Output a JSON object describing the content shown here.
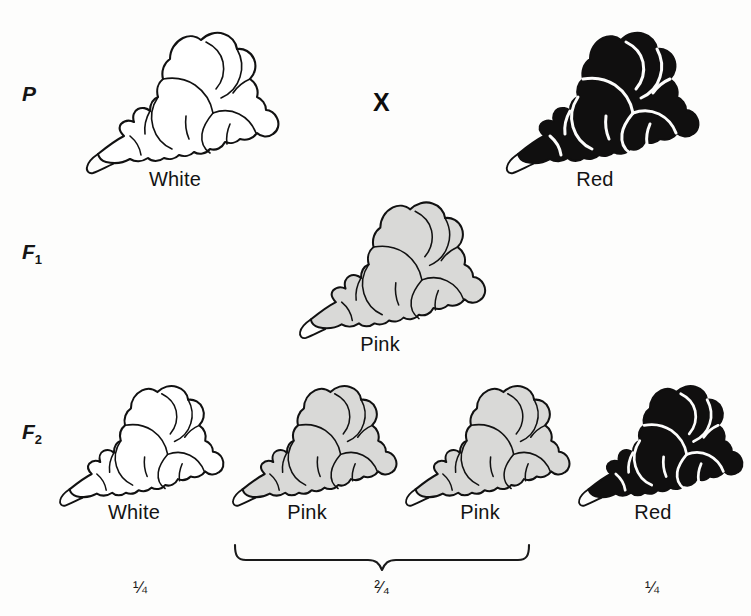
{
  "figure": {
    "background_color": "#fdfdfc"
  },
  "colors": {
    "outline": "#111111",
    "white_fill": "#ffffff",
    "pink_fill": "#d9d9d7",
    "red_fill": "#100f0f",
    "red_detail_line": "#fdfdfc"
  },
  "generations": {
    "parental": {
      "label": "P",
      "subscript": "",
      "cross_symbol": "X",
      "specimens": [
        {
          "caption": "White",
          "phenotype": "white"
        },
        {
          "caption": "Red",
          "phenotype": "red"
        }
      ]
    },
    "f1": {
      "label": "F",
      "subscript": "1",
      "specimens": [
        {
          "caption": "Pink",
          "phenotype": "pink"
        }
      ]
    },
    "f2": {
      "label": "F",
      "subscript": "2",
      "specimens": [
        {
          "caption": "White",
          "phenotype": "white"
        },
        {
          "caption": "Pink",
          "phenotype": "pink"
        },
        {
          "caption": "Pink",
          "phenotype": "pink"
        },
        {
          "caption": "Red",
          "phenotype": "red"
        }
      ],
      "ratios": [
        {
          "text": "¼",
          "covers": "White"
        },
        {
          "text": "²⁄₄",
          "covers": "Pink + Pink"
        },
        {
          "text": "¼",
          "covers": "Red"
        }
      ],
      "brace_groups": "Pink and Pink grouped by curly brace"
    }
  }
}
